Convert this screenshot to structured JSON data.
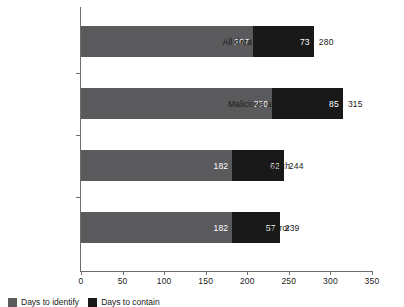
{
  "chart_data": {
    "type": "bar",
    "orientation": "horizontal",
    "stacked": true,
    "title": "",
    "xlabel": "",
    "ylabel": "",
    "categories": [
      "All data breaches",
      "Malicious attack",
      "System glitch",
      "Human error"
    ],
    "series": [
      {
        "name": "Days to identify",
        "color": "#5a5a5c",
        "values": [
          207,
          230,
          182,
          182
        ]
      },
      {
        "name": "Days to contain",
        "color": "#191919",
        "values": [
          73,
          85,
          62,
          57
        ]
      }
    ],
    "totals": [
      280,
      315,
      244,
      239
    ],
    "xlim": [
      0,
      350
    ],
    "xticks": [
      0,
      50,
      100,
      150,
      200,
      250,
      300,
      350
    ],
    "xticklabels": [
      "0",
      "50",
      "100",
      "150",
      "200",
      "250",
      "300",
      "350"
    ],
    "grid": false,
    "legend_position": "bottom-left"
  },
  "legend": {
    "items": [
      {
        "label": "Days to identify",
        "swatch": "legend-swatch-days-to-identify"
      },
      {
        "label": "Days to contain",
        "swatch": "legend-swatch-days-to-contain"
      }
    ]
  },
  "colors": {
    "identify": "#5a5a5c",
    "contain": "#191919",
    "axis": "#6d6d6d",
    "text": "#1a1a1a",
    "background": "#ffffff"
  }
}
